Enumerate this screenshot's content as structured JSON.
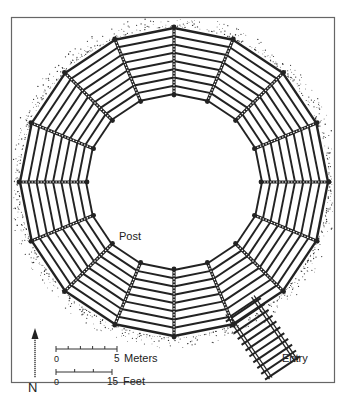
{
  "figure": {
    "type": "archaeological plan diagram",
    "colors": {
      "ink": "#222222",
      "frame": "#666666",
      "background": "#ffffff",
      "stipple": "#333333"
    },
    "geometry": {
      "center": [
        174,
        182
      ],
      "outer_radius": 154,
      "inner_radius": 88,
      "segments": 16,
      "planks_per_segment": 8
    }
  },
  "labels": {
    "post": "Post",
    "entry": "Entry",
    "north": "N"
  },
  "scale_bars": [
    {
      "name": "meters",
      "start": "0",
      "end": "5",
      "unit": "Meters",
      "ticks": 6
    },
    {
      "name": "feet",
      "start": "0",
      "end": "15",
      "unit": "Feet",
      "ticks": 4
    }
  ]
}
